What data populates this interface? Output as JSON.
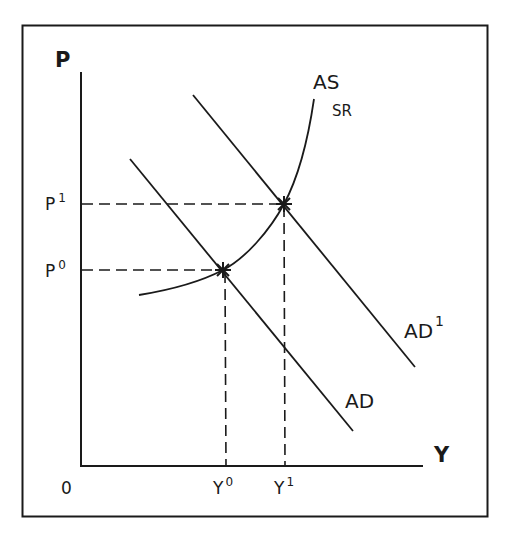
{
  "diagram": {
    "axes": {
      "y_axis_label": "P",
      "x_axis_label": "Y",
      "origin_label": "0"
    },
    "price_levels": [
      {
        "base": "P",
        "sup": "0"
      },
      {
        "base": "P",
        "sup": "1"
      }
    ],
    "output_levels": [
      {
        "base": "Y",
        "sup": "0"
      },
      {
        "base": "Y",
        "sup": "1"
      }
    ],
    "curves": {
      "as_sr": {
        "main": "AS",
        "sub": "SR"
      },
      "ad": {
        "main": "AD"
      },
      "ad1": {
        "main": "AD",
        "sup": "1"
      }
    },
    "equilibria": [
      {
        "name": "E0",
        "at": "Y0,P0"
      },
      {
        "name": "E1",
        "at": "Y1,P1"
      }
    ],
    "colors": {
      "ink": "#1a1a1a",
      "background": "#ffffff"
    }
  }
}
